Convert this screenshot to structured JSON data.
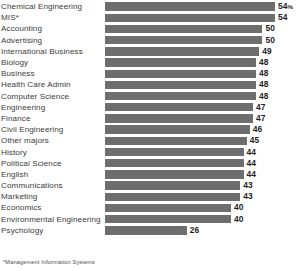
{
  "footnote": "*Management Information Systems",
  "chart_data": {
    "type": "bar",
    "orientation": "horizontal",
    "title": "",
    "subtitle": "",
    "xlabel": "",
    "ylabel": "",
    "grid": false,
    "legend": false,
    "xlim": [
      0,
      54
    ],
    "value_suffix_first": "%",
    "bar_color": "#6e6e6e",
    "categories": [
      "Chemical Engineering",
      "MIS*",
      "Accounting",
      "Advertising",
      "International Business",
      "Biology",
      "Business",
      "Health Care Admin",
      "Computer Science",
      "Engineering",
      "Finance",
      "Civil Engineering",
      "Other majors",
      "History",
      "Political Science",
      "English",
      "Communications",
      "Marketing",
      "Economics",
      "Environmental Engineering",
      "Psychology"
    ],
    "values": [
      54,
      54,
      50,
      50,
      49,
      48,
      48,
      48,
      48,
      47,
      47,
      46,
      45,
      44,
      44,
      44,
      43,
      43,
      40,
      40,
      26
    ],
    "value_labels": [
      "54%",
      "54",
      "50",
      "50",
      "49",
      "48",
      "48",
      "48",
      "48",
      "47",
      "47",
      "46",
      "45",
      "44",
      "44",
      "44",
      "43",
      "43",
      "40",
      "40",
      "26"
    ]
  }
}
